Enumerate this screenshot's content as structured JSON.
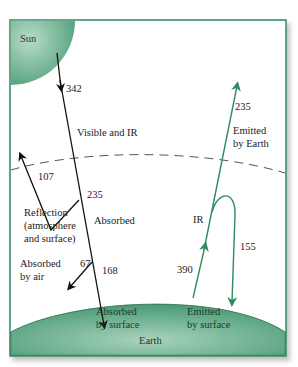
{
  "colors": {
    "frame": "#3f8f6a",
    "fill_light": "#a9d4bd",
    "fill_dark": "#4e9e78",
    "incoming_arrow": "#111111",
    "outgoing_arrow": "#2f8a5f",
    "dashed_line": "#555555"
  },
  "bodies": {
    "sun": "Sun",
    "earth": "Earth"
  },
  "incoming": {
    "solar_input_value": "342",
    "band_label": "Visible and IR",
    "reflected_value": "107",
    "reflection_label_lines": [
      "Reflection",
      "(atmosphere",
      "and surface)"
    ],
    "absorbed_total_value": "235",
    "absorbed_label": "Absorbed",
    "absorbed_by_air_value": "67",
    "absorbed_by_air_label_lines": [
      "Absorbed",
      "by air"
    ],
    "absorbed_by_surface_value": "168",
    "absorbed_by_surface_label_lines": [
      "Absorbed",
      "by surface"
    ]
  },
  "outgoing": {
    "emitted_by_earth_value": "235",
    "emitted_by_earth_label_lines": [
      "Emitted",
      "by Earth"
    ],
    "ir_label": "IR",
    "emitted_by_surface_value": "390",
    "emitted_by_surface_label_lines": [
      "Emitted",
      "by surface"
    ],
    "back_radiation_value": "155"
  }
}
